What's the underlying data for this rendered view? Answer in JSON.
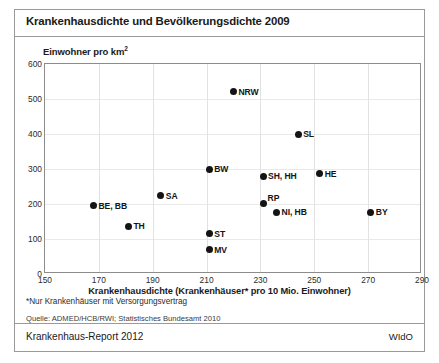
{
  "figure": {
    "title": "Krankenhausdichte und Bevölkerungsdichte 2009",
    "footnote": "*Nur Krankenhäuser mit Versorgungsvertrag",
    "source": "Quelle: ADMED/HCB/RWI; Statistisches Bundesamt 2010",
    "footer_left": "Krankenhaus-Report 2012",
    "footer_right": "WIdO"
  },
  "chart_data": {
    "type": "scatter",
    "title": "Krankenhausdichte und Bevölkerungsdichte 2009",
    "xlabel": "Krankenhausdichte (Krankenhäuser* pro 10 Mio. Einwohner)",
    "ylabel": "Einwohner pro km²",
    "xlim": [
      150,
      290
    ],
    "ylim": [
      0,
      600
    ],
    "xticks": [
      150,
      170,
      190,
      210,
      230,
      250,
      270,
      290
    ],
    "yticks": [
      0,
      100,
      200,
      300,
      400,
      500,
      600
    ],
    "grid": true,
    "legend": "none",
    "marker_color": "#141414",
    "points": [
      {
        "label": "BE, BB",
        "x": 168,
        "y": 195,
        "label_pos": "right"
      },
      {
        "label": "TH",
        "x": 181,
        "y": 137,
        "label_pos": "right"
      },
      {
        "label": "SA",
        "x": 193,
        "y": 223,
        "label_pos": "right"
      },
      {
        "label": "BW",
        "x": 211,
        "y": 300,
        "label_pos": "right"
      },
      {
        "label": "ST",
        "x": 211,
        "y": 115,
        "label_pos": "right"
      },
      {
        "label": "MV",
        "x": 211,
        "y": 70,
        "label_pos": "right"
      },
      {
        "label": "NRW",
        "x": 220,
        "y": 521,
        "label_pos": "right"
      },
      {
        "label": "SH, HH",
        "x": 231,
        "y": 279,
        "label_pos": "right"
      },
      {
        "label": "RP",
        "x": 231,
        "y": 201,
        "label_pos": "upright"
      },
      {
        "label": "NI, HB",
        "x": 236,
        "y": 177,
        "label_pos": "right"
      },
      {
        "label": "SL",
        "x": 244,
        "y": 399,
        "label_pos": "right"
      },
      {
        "label": "HE",
        "x": 252,
        "y": 286,
        "label_pos": "right"
      },
      {
        "label": "BY",
        "x": 271,
        "y": 177,
        "label_pos": "right"
      }
    ]
  }
}
